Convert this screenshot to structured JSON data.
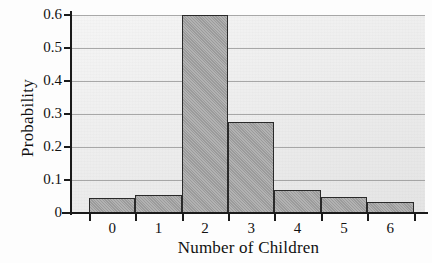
{
  "chart_data": {
    "type": "bar",
    "title": "",
    "subtitle": "",
    "xlabel": "Number of Children",
    "ylabel": "Probability",
    "categories": [
      "0",
      "1",
      "2",
      "3",
      "4",
      "5",
      "6"
    ],
    "values": [
      0.045,
      0.055,
      0.6,
      0.275,
      0.07,
      0.048,
      0.032
    ],
    "series": [
      {
        "name": "Probability",
        "values": [
          0.045,
          0.055,
          0.6,
          0.275,
          0.07,
          0.048,
          0.032
        ]
      }
    ],
    "ylim": [
      0,
      0.6
    ],
    "xlim": [
      -0.5,
      6.5
    ],
    "ytick_labels": [
      "0.6",
      "0.5",
      "0.4",
      "0.3",
      "0.2",
      "0.1",
      "0"
    ],
    "ytick_values": [
      0.6,
      0.5,
      0.4,
      0.3,
      0.2,
      0.1,
      0
    ],
    "xtick_labels": [
      "0",
      "1",
      "2",
      "3",
      "4",
      "5",
      "6"
    ],
    "grid": true,
    "grid_axis": "y",
    "legend": null,
    "legend_position": "none",
    "bar_fill_color": "#a3a3a3",
    "bar_edge_color": "#2a2a2a",
    "plot_background_color": "#e9e9e9",
    "axis_color": "#1a1a1a",
    "gridline_color": "#8f8f8f",
    "annotations": []
  }
}
